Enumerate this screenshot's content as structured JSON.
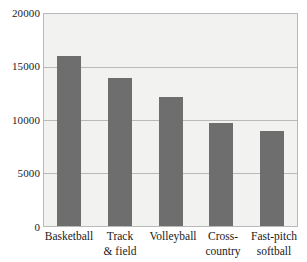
{
  "chart_data": {
    "type": "bar",
    "title": "",
    "subtitle": "",
    "xlabel": "",
    "ylabel": "",
    "categories": [
      "Basketball",
      "Track & field",
      "Volleyball",
      "Cross-country",
      "Fast-pitch softball"
    ],
    "values": [
      16000,
      14000,
      12200,
      9700,
      9000
    ],
    "ylim": [
      0,
      20000
    ],
    "yticks": [
      0,
      5000,
      10000,
      15000,
      20000
    ],
    "ytick_labels": [
      "0",
      "5000",
      "10000",
      "15000",
      "20000"
    ],
    "grid": "horizontal",
    "legend": "none",
    "bar_color": "#6e6e6e",
    "plot_background": "#f2f2f0",
    "grid_color": "#b9b9b7",
    "axis_color": "#b9b9b7",
    "text_color": "#1a1a1a"
  },
  "axes": {
    "y_labels": [
      {
        "text": "20000",
        "value": 20000
      },
      {
        "text": "15000",
        "value": 15000
      },
      {
        "text": "10000",
        "value": 10000
      },
      {
        "text": "5000",
        "value": 5000
      },
      {
        "text": "0",
        "value": 0
      }
    ],
    "x_labels": [
      {
        "line1": "Basketball",
        "line2": ""
      },
      {
        "line1": "Track",
        "line2": "& field"
      },
      {
        "line1": "Volleyball",
        "line2": ""
      },
      {
        "line1": "Cross-",
        "line2": "country"
      },
      {
        "line1": "Fast-pitch",
        "line2": "softball"
      }
    ]
  }
}
